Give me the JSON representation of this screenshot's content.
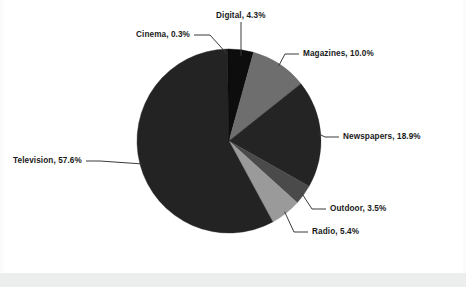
{
  "chart_data": {
    "type": "pie",
    "title": "",
    "subtitle": "",
    "xlabel": "",
    "ylabel": "",
    "legend_position": "none",
    "labels_outside": true,
    "categories": [
      "Digital",
      "Magazines",
      "Newspapers",
      "Outdoor",
      "Radio",
      "Television",
      "Cinema"
    ],
    "values": [
      4.3,
      10.0,
      18.9,
      3.5,
      5.4,
      57.6,
      0.3
    ],
    "units": "percent",
    "slices": [
      {
        "name": "Digital",
        "value": 4.3,
        "label": "Digital, 4.3%",
        "color": "#0d0d0d",
        "label_x": 216,
        "label_y": 12,
        "leader": "vertical"
      },
      {
        "name": "Magazines",
        "value": 10.0,
        "label": "Magazines, 10.0%",
        "color": "#6e6e6e",
        "label_x": 303,
        "label_y": 50,
        "leader": "right"
      },
      {
        "name": "Newspapers",
        "value": 18.9,
        "label": "Newspapers, 18.9%",
        "color": "#242424",
        "label_x": 343,
        "label_y": 133,
        "leader": "right"
      },
      {
        "name": "Outdoor",
        "value": 3.5,
        "label": "Outdoor, 3.5%",
        "color": "#4a4a4a",
        "label_x": 330,
        "label_y": 205,
        "leader": "right"
      },
      {
        "name": "Radio",
        "value": 5.4,
        "label": "Radio, 5.4%",
        "color": "#9a9a9a",
        "label_x": 312,
        "label_y": 228,
        "leader": "right"
      },
      {
        "name": "Television",
        "value": 57.6,
        "label": "Television, 57.6%",
        "color": "#232323",
        "label_x": 13,
        "label_y": 157,
        "leader": "left"
      },
      {
        "name": "Cinema",
        "value": 0.3,
        "label": "Cinema, 0.3%",
        "color": "#0a0a0a",
        "label_x": 136,
        "label_y": 31,
        "leader": "left-diagonal"
      }
    ],
    "geometry": {
      "center_x": 229,
      "center_y": 141,
      "radius": 92,
      "start_angle_deg": -90,
      "direction": "clockwise"
    },
    "colors": {
      "background": "#ffffff",
      "text": "#1a1a1a",
      "leader_line": "#3a3a3a",
      "bottom_band": "#eceded"
    }
  }
}
